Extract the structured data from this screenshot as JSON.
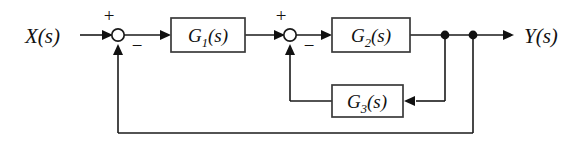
{
  "diagram": {
    "type": "control-system-block-diagram",
    "background_color": "#ffffff",
    "line_color": "#1a1a1a",
    "block_border_color": "#3a3a3a",
    "signals": {
      "input_label": "X(s)",
      "output_label": "Y(s)"
    },
    "blocks": [
      {
        "id": "g1",
        "label_main": "G",
        "label_sub": "1",
        "label_suffix": "(s)",
        "full_label": "G1(s)"
      },
      {
        "id": "g2",
        "label_main": "G",
        "label_sub": "2",
        "label_suffix": "(s)",
        "full_label": "G2(s)"
      },
      {
        "id": "g3",
        "label_main": "G",
        "label_sub": "3",
        "label_suffix": "(s)",
        "full_label": "G3(s)"
      }
    ],
    "summing_junctions": [
      {
        "id": "sum1",
        "plus_sign": "+",
        "minus_sign": "−"
      },
      {
        "id": "sum2",
        "plus_sign": "+",
        "minus_sign": "−"
      }
    ],
    "junction_dots": [
      {
        "id": "dot-inner-tap"
      },
      {
        "id": "dot-outer-tap"
      }
    ]
  }
}
